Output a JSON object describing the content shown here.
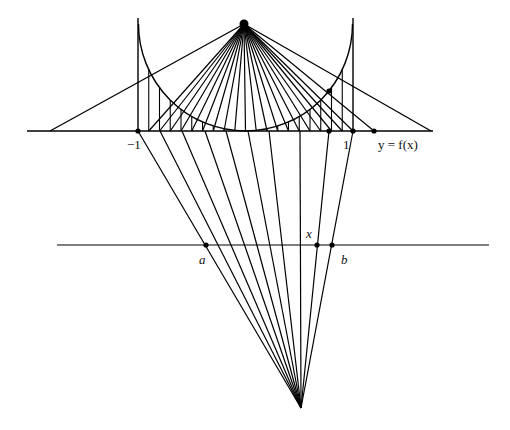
{
  "caption_fragment": "",
  "labels": {
    "minus_one": "−1",
    "one": "1",
    "curve_label": "y = f(x)",
    "a": "a",
    "b": "b",
    "x": "x"
  },
  "geometry": {
    "top_apex": [
      244,
      24
    ],
    "bottom_apex": [
      301,
      408
    ],
    "axis_y": 131,
    "axis_x_range": [
      27,
      433
    ],
    "second_line_y": 245,
    "second_line_x_range": [
      57,
      489
    ],
    "unit_px": 107.5,
    "center_x": 245.5,
    "arc_center": [
      245.5,
      24
    ],
    "arc_radius": 107,
    "left_vertical_x": 138,
    "right_vertical_x": 353,
    "vertical_top_y": 18,
    "axis_t_values": [
      -0.9,
      -0.8,
      -0.7,
      -0.6,
      -0.5,
      -0.4,
      -0.3,
      -0.2,
      -0.1,
      0,
      0.1,
      0.2,
      0.3,
      0.4,
      0.5,
      0.6,
      0.7,
      0.8,
      0.9
    ],
    "outer_axis_hits": [
      50,
      431
    ],
    "marked_points_axis_x": [
      138,
      329,
      353,
      374
    ],
    "second_line_points_x": [
      206,
      317,
      332
    ]
  },
  "stroke_color": "#000000",
  "background": "#ffffff"
}
